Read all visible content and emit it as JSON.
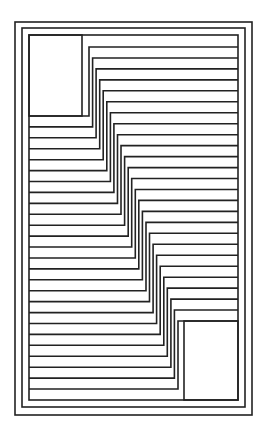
{
  "figure": {
    "title": "",
    "stroke_color": "#222222",
    "background": "#ffffff",
    "frames": [
      {
        "x": 15,
        "y": 22,
        "w": 237,
        "h": 393
      },
      {
        "x": 22,
        "y": 28,
        "w": 223,
        "h": 379
      },
      {
        "x": 29,
        "y": 35,
        "w": 209,
        "h": 365
      }
    ],
    "top_left_box": {
      "x": 29,
      "y": 35,
      "w": 53,
      "h": 81
    },
    "bottom_right_box": {
      "x": 184,
      "y": 321,
      "w": 54,
      "h": 79
    },
    "stepped_lines": 26
  }
}
